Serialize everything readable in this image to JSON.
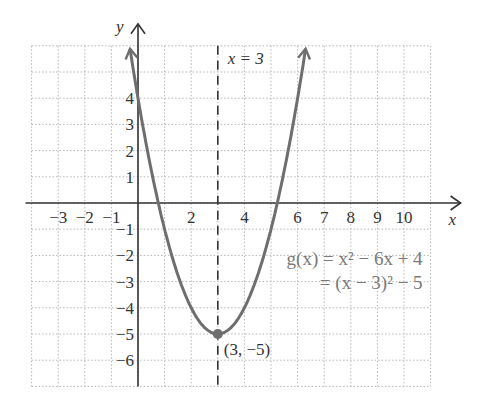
{
  "chart_data": {
    "type": "line",
    "title": "",
    "function_name": "g(x)",
    "equation_line1": "g(x) = x² − 6x + 4",
    "equation_line2": "= (x − 3)² − 5",
    "xlabel": "x",
    "ylabel": "y",
    "xlim": [
      -4,
      11
    ],
    "ylim": [
      -7,
      6
    ],
    "grid": true,
    "x_ticks": [
      -3,
      -2,
      -1,
      2,
      4,
      6,
      7,
      8,
      9,
      10
    ],
    "x_tick_labels": [
      "−3",
      "−2",
      "−1",
      "2",
      "4",
      "6",
      "7",
      "8",
      "9",
      "10"
    ],
    "y_ticks": [
      4,
      3,
      2,
      1,
      -1,
      -2,
      -3,
      -4,
      -5,
      -6
    ],
    "y_tick_labels": [
      "4",
      "3",
      "2",
      "1",
      "−1",
      "−2",
      "−3",
      "−4",
      "−5",
      "−6"
    ],
    "series": [
      {
        "name": "g(x) = x^2 - 6x + 4",
        "x": [
          -0.3,
          0,
          1,
          2,
          3,
          4,
          5,
          6,
          6.3
        ],
        "values": [
          5.89,
          4,
          -1,
          -4,
          -5,
          -4,
          -1,
          4,
          5.89
        ]
      }
    ],
    "axis_of_symmetry": {
      "label": "x = 3",
      "x": 3,
      "style": "dashed"
    },
    "vertex": {
      "label": "(3, −5)",
      "x": 3,
      "y": -5
    },
    "colors": {
      "curve": "#6e6e6e",
      "axes": "#333333",
      "grid": "#b5b5b5",
      "equation": "#7a7a7a"
    }
  }
}
